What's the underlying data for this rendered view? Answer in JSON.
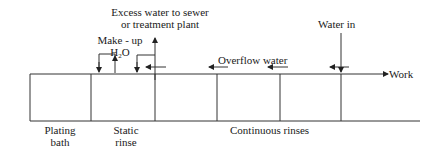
{
  "labels": {
    "excess_line1": "Excess water to sewer",
    "excess_line2": "or treatment plant",
    "makeup_line1": "Make - up",
    "makeup_h": "H",
    "makeup_sub": "2",
    "makeup_o": "O",
    "overflow": "Overflow water",
    "water_in": "Water in",
    "work": "Work",
    "plating_line1": "Plating",
    "plating_line2": "bath",
    "static_line1": "Static",
    "static_line2": "rinse",
    "continuous": "Continuous rinses"
  },
  "colors": {
    "line": "#333333",
    "text": "#1a1a1a",
    "background": "#ffffff"
  }
}
